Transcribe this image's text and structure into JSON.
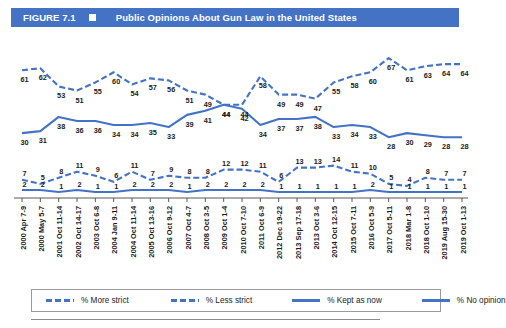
{
  "header": {
    "figure_number": "FIGURE 7.1",
    "marker": "square-marker",
    "title": "Public Opinions About Gun Law in the United States"
  },
  "colors": {
    "header_bg": "#4472c4",
    "header_text": "#ffffff",
    "series_line": "#4472c4",
    "label_text": "#1b1b1b",
    "axis": "#595959",
    "legend_border": "#9a9a9a"
  },
  "legend": {
    "position": "bottom",
    "items": [
      {
        "label": "% More strict",
        "style": "dashed",
        "color": "#4472c4"
      },
      {
        "label": "% Less strict",
        "style": "dashed",
        "color": "#4472c4"
      },
      {
        "label": "% Kept as now",
        "style": "solid",
        "color": "#4472c4"
      },
      {
        "label": "% No opinion",
        "style": "solid",
        "color": "#4472c4"
      }
    ]
  },
  "chart_data": {
    "type": "line",
    "title": "Public Opinions About Gun Law in the United States",
    "xlabel": "",
    "ylabel": "",
    "grid": false,
    "legend_position": "bottom",
    "ylim": [
      0,
      70
    ],
    "categories": [
      "2000 Apr 7-9",
      "2000 May 5-7",
      "2001 Oct 11-14",
      "2002 Oct 14-17",
      "2003 Oct 6-8",
      "2004 Jan 9-11",
      "2004 Oct 11-14",
      "2005 Oct 13-16",
      "2006 Oct 9-12",
      "2007 Oct 4-7",
      "2008 Oct 3-5",
      "2009 Oct 1-4",
      "2010 Oct 7-10",
      "2011 Oct 6-9",
      "2012 Dec 19-22",
      "2013 Sep 17-18",
      "2013 Oct 3-6",
      "2014 Oct 12-15",
      "2015 Oct 7-11",
      "2016 Oct 5-9",
      "2017 Oct 5-11",
      "2018 Mar 1-8",
      "2018 Oct 1-10",
      "2019 Aug 15-30",
      "2019 Oct 1-13"
    ],
    "series": [
      {
        "name": "% More strict",
        "style": "dashed",
        "color": "#4472c4",
        "values": [
          61,
          62,
          53,
          51,
          55,
          60,
          54,
          57,
          56,
          51,
          49,
          44,
          44,
          58,
          49,
          49,
          47,
          55,
          58,
          60,
          67,
          61,
          63,
          64,
          64
        ]
      },
      {
        "name": "% Kept as now",
        "style": "solid",
        "color": "#4472c4",
        "values": [
          30,
          31,
          38,
          36,
          36,
          34,
          34,
          35,
          33,
          39,
          41,
          44,
          42,
          34,
          37,
          37,
          38,
          33,
          34,
          33,
          28,
          30,
          29,
          28,
          28
        ]
      },
      {
        "name": "% Less strict",
        "style": "dashed",
        "color": "#4472c4",
        "values": [
          7,
          5,
          8,
          11,
          9,
          6,
          11,
          7,
          9,
          8,
          8,
          12,
          12,
          11,
          6,
          13,
          13,
          14,
          11,
          10,
          5,
          4,
          8,
          7,
          7
        ]
      },
      {
        "name": "% No opinion",
        "style": "solid",
        "color": "#4472c4",
        "values": [
          2,
          2,
          1,
          2,
          1,
          1,
          2,
          2,
          2,
          1,
          2,
          2,
          2,
          2,
          1,
          1,
          1,
          1,
          1,
          2,
          1,
          1,
          1,
          1,
          1
        ]
      }
    ]
  }
}
